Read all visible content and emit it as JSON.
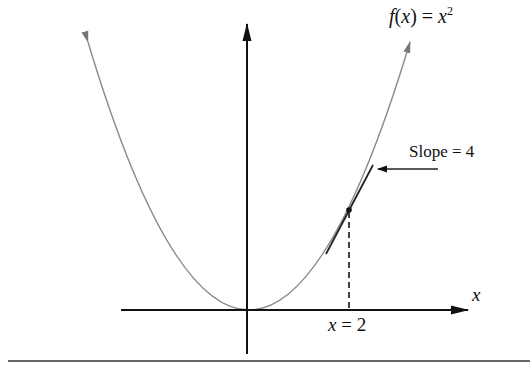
{
  "diagram": {
    "function_label": {
      "prefix": "f",
      "paren": "(x)",
      "eq": " = ",
      "base": "x",
      "exp": "2"
    },
    "slope_label": "Slope = 4",
    "x_axis_label": "x",
    "point_label": {
      "var": "x",
      "eq": " = ",
      "val": "2"
    },
    "function": "f(x) = x^2",
    "tangent_point": {
      "x": 2,
      "y": 4
    },
    "tangent_slope": 4,
    "colors": {
      "axis": "#111111",
      "curve": "#8a8a8a",
      "tangent": "#222222",
      "rule": "#333333"
    }
  }
}
